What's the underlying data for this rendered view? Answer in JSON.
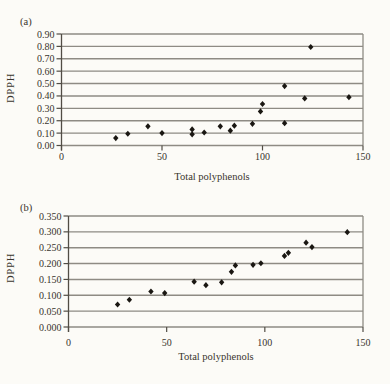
{
  "page": {
    "background": "#fcfbf7",
    "text_color": "#39352d",
    "grid_color": "#8e8b84",
    "axis_color": "#514d45",
    "marker_color": "#1a1712"
  },
  "chart_data": [
    {
      "id": "a",
      "type": "scatter",
      "panel_label": "(a)",
      "xlabel": "Total polyphenols",
      "ylabel": "DPPH",
      "xlim": [
        0,
        150
      ],
      "ylim": [
        0,
        0.9
      ],
      "grid": true,
      "legend": "none",
      "marker": "diamond",
      "x_tick_values": [
        0,
        50,
        100,
        150
      ],
      "x_tick_labels": [
        "0",
        "50",
        "100",
        "150"
      ],
      "y_tick_values": [
        0.9,
        0.8,
        0.7,
        0.6,
        0.5,
        0.4,
        0.3,
        0.2,
        0.1,
        0.0
      ],
      "y_tick_labels": [
        "0.90",
        "0.80",
        "0.70",
        "0.60",
        "0.50",
        "0.40",
        "0.30",
        "0.20",
        "0.10",
        "0.00"
      ],
      "points": [
        [
          27,
          0.06
        ],
        [
          33,
          0.095
        ],
        [
          43,
          0.155
        ],
        [
          50,
          0.1
        ],
        [
          65,
          0.09
        ],
        [
          65,
          0.13
        ],
        [
          71,
          0.105
        ],
        [
          79,
          0.155
        ],
        [
          84,
          0.12
        ],
        [
          86,
          0.16
        ],
        [
          95,
          0.175
        ],
        [
          99,
          0.275
        ],
        [
          100,
          0.335
        ],
        [
          111,
          0.18
        ],
        [
          111,
          0.48
        ],
        [
          121,
          0.38
        ],
        [
          124,
          0.795
        ],
        [
          143,
          0.39
        ]
      ]
    },
    {
      "id": "b",
      "type": "scatter",
      "panel_label": "(b)",
      "xlabel": "Total polyphenols",
      "ylabel": "DPPH",
      "xlim": [
        0,
        150
      ],
      "ylim": [
        0,
        0.35
      ],
      "grid": true,
      "legend": "none",
      "marker": "diamond",
      "x_tick_values": [
        0,
        50,
        100,
        150
      ],
      "x_tick_labels": [
        "0",
        "50",
        "100",
        "150"
      ],
      "y_tick_values": [
        0.35,
        0.3,
        0.25,
        0.2,
        0.15,
        0.1,
        0.05,
        0.0
      ],
      "y_tick_labels": [
        "0.350",
        "0.300",
        "0.250",
        "0.200",
        "0.150",
        "0.100",
        "0.050",
        "0.000"
      ],
      "points": [
        [
          25,
          0.071
        ],
        [
          31,
          0.086
        ],
        [
          42,
          0.112
        ],
        [
          49,
          0.107
        ],
        [
          64,
          0.143
        ],
        [
          70,
          0.132
        ],
        [
          78,
          0.141
        ],
        [
          83,
          0.174
        ],
        [
          85,
          0.194
        ],
        [
          94,
          0.196
        ],
        [
          98,
          0.201
        ],
        [
          110,
          0.224
        ],
        [
          112,
          0.234
        ],
        [
          121,
          0.266
        ],
        [
          124,
          0.252
        ],
        [
          142,
          0.299
        ]
      ]
    }
  ]
}
